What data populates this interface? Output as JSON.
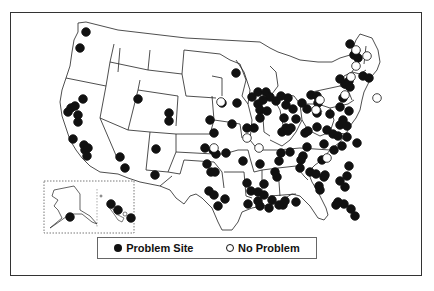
{
  "map": {
    "region": "Contiguous United States with Alaska and Hawaii insets",
    "colors": {
      "problem": "#111111",
      "no_problem": "#ffffff",
      "border": "#333333"
    }
  },
  "legend": {
    "items": [
      {
        "symbol": "filled-circle",
        "label": "Problem Site"
      },
      {
        "symbol": "open-circle",
        "label": "No Problem"
      }
    ]
  },
  "sites": {
    "problem": [
      [
        86,
        32
      ],
      [
        80,
        48
      ],
      [
        83,
        99
      ],
      [
        71,
        108
      ],
      [
        68,
        112
      ],
      [
        75,
        106
      ],
      [
        78,
        115
      ],
      [
        78,
        122
      ],
      [
        138,
        99
      ],
      [
        169,
        113
      ],
      [
        169,
        121
      ],
      [
        214,
        133
      ],
      [
        73,
        139
      ],
      [
        84,
        145
      ],
      [
        85,
        150
      ],
      [
        88,
        148
      ],
      [
        87,
        156
      ],
      [
        120,
        157
      ],
      [
        125,
        168
      ],
      [
        155,
        175
      ],
      [
        156,
        149
      ],
      [
        236,
        73
      ],
      [
        222,
        103
      ],
      [
        237,
        103
      ],
      [
        210,
        120
      ],
      [
        232,
        124
      ],
      [
        252,
        97
      ],
      [
        258,
        92
      ],
      [
        266,
        92
      ],
      [
        270,
        97
      ],
      [
        263,
        100
      ],
      [
        258,
        104
      ],
      [
        276,
        101
      ],
      [
        260,
        110
      ],
      [
        267,
        111
      ],
      [
        286,
        105
      ],
      [
        288,
        98
      ],
      [
        281,
        96
      ],
      [
        293,
        109
      ],
      [
        302,
        103
      ],
      [
        284,
        118
      ],
      [
        296,
        119
      ],
      [
        291,
        128
      ],
      [
        286,
        128
      ],
      [
        307,
        109
      ],
      [
        311,
        95
      ],
      [
        317,
        96
      ],
      [
        318,
        103
      ],
      [
        317,
        113
      ],
      [
        330,
        114
      ],
      [
        343,
        98
      ],
      [
        345,
        84
      ],
      [
        247,
        128
      ],
      [
        254,
        128
      ],
      [
        260,
        118
      ],
      [
        282,
        132
      ],
      [
        288,
        131
      ],
      [
        305,
        133
      ],
      [
        308,
        131
      ],
      [
        317,
        127
      ],
      [
        327,
        130
      ],
      [
        340,
        107
      ],
      [
        343,
        120
      ],
      [
        349,
        111
      ],
      [
        340,
        125
      ],
      [
        347,
        126
      ],
      [
        347,
        137
      ],
      [
        357,
        143
      ],
      [
        324,
        144
      ],
      [
        333,
        134
      ],
      [
        338,
        136
      ],
      [
        350,
        44
      ],
      [
        354,
        55
      ],
      [
        358,
        58
      ],
      [
        349,
        81
      ],
      [
        363,
        76
      ],
      [
        369,
        78
      ],
      [
        340,
        79
      ],
      [
        350,
        87
      ],
      [
        205,
        148
      ],
      [
        213,
        150
      ],
      [
        216,
        154
      ],
      [
        226,
        153
      ],
      [
        207,
        164
      ],
      [
        211,
        172
      ],
      [
        243,
        161
      ],
      [
        260,
        164
      ],
      [
        215,
        172
      ],
      [
        209,
        191
      ],
      [
        214,
        195
      ],
      [
        225,
        199
      ],
      [
        218,
        206
      ],
      [
        247,
        183
      ],
      [
        251,
        191
      ],
      [
        258,
        192
      ],
      [
        264,
        184
      ],
      [
        264,
        195
      ],
      [
        277,
        177
      ],
      [
        279,
        161
      ],
      [
        275,
        172
      ],
      [
        281,
        153
      ],
      [
        290,
        152
      ],
      [
        303,
        156
      ],
      [
        307,
        147
      ],
      [
        301,
        160
      ],
      [
        300,
        168
      ],
      [
        310,
        172
      ],
      [
        316,
        174
      ],
      [
        324,
        177
      ],
      [
        322,
        160
      ],
      [
        334,
        150
      ],
      [
        342,
        146
      ],
      [
        349,
        166
      ],
      [
        347,
        176
      ],
      [
        340,
        181
      ],
      [
        345,
        187
      ],
      [
        272,
        200
      ],
      [
        283,
        205
      ],
      [
        285,
        201
      ],
      [
        296,
        202
      ],
      [
        325,
        175
      ],
      [
        319,
        186
      ],
      [
        320,
        190
      ],
      [
        344,
        204
      ],
      [
        351,
        209
      ],
      [
        355,
        216
      ],
      [
        336,
        205
      ],
      [
        338,
        202
      ],
      [
        248,
        204
      ],
      [
        258,
        201
      ],
      [
        260,
        206
      ],
      [
        269,
        208
      ],
      [
        279,
        205
      ],
      [
        70,
        217
      ],
      [
        111,
        204
      ],
      [
        118,
        210
      ],
      [
        131,
        218
      ]
    ],
    "no_problem": [
      [
        214,
        148
      ],
      [
        221,
        102
      ],
      [
        247,
        138
      ],
      [
        259,
        148
      ],
      [
        320,
        100
      ],
      [
        316,
        110
      ],
      [
        356,
        50
      ],
      [
        356,
        66
      ],
      [
        351,
        77
      ],
      [
        345,
        95
      ],
      [
        367,
        56
      ],
      [
        327,
        158
      ],
      [
        377,
        98
      ]
    ]
  }
}
